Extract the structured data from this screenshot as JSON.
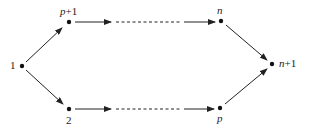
{
  "diagram": {
    "type": "directed-graph",
    "colors": {
      "stroke": "#222222",
      "node": "#111111",
      "background": "#ffffff"
    },
    "nodes": [
      {
        "id": "1",
        "label": "1",
        "x": 22,
        "y": 66
      },
      {
        "id": "p+1",
        "label_var": "p",
        "label_suffix": "+1",
        "x": 69,
        "y": 22
      },
      {
        "id": "2",
        "label": "2",
        "x": 69,
        "y": 109
      },
      {
        "id": "n",
        "label_var": "n",
        "x": 221,
        "y": 21
      },
      {
        "id": "p",
        "label_var": "p",
        "x": 220,
        "y": 108
      },
      {
        "id": "n+1",
        "label_var": "n",
        "label_suffix": "+1",
        "x": 272,
        "y": 64
      }
    ],
    "edges": [
      {
        "from": "1",
        "to": "p+1",
        "style": "solid"
      },
      {
        "from": "1",
        "to": "2",
        "style": "solid"
      },
      {
        "from": "p+1",
        "to": "n",
        "style": "solid-dashed-solid"
      },
      {
        "from": "2",
        "to": "p",
        "style": "solid-dashed-solid"
      },
      {
        "from": "n",
        "to": "n+1",
        "style": "solid"
      },
      {
        "from": "p",
        "to": "n+1",
        "style": "solid"
      }
    ]
  }
}
